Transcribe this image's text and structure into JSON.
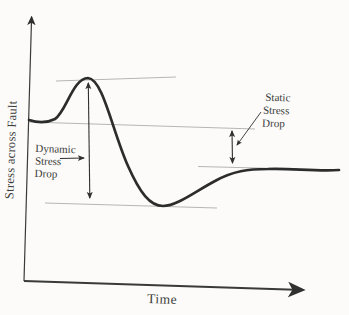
{
  "figure": {
    "kind": "stress-vs-time-diagram",
    "y_axis_label": "Stress across Fault",
    "x_axis_label": "Time",
    "annotations": {
      "dynamic_stress_drop": {
        "line1": "Dynamic",
        "line2": "Stress",
        "line3": "Drop"
      },
      "static_stress_drop": {
        "line1": "Static",
        "line2": "Stress",
        "line3": "Drop"
      }
    },
    "curve_description": "Stress starts at initial level, rises to a peak overshoot, drops below to a trough (dynamic stress drop from peak to trough), then recovers to a final level below the initial level (static stress drop from initial to final level)",
    "colors": {
      "background": "#fcfbf9",
      "curve": "#2c2c2c",
      "axis": "#3a3a3a",
      "reference_line": "#a3a3a3",
      "arrow": "#303030",
      "text": "#3b3b3b"
    }
  }
}
